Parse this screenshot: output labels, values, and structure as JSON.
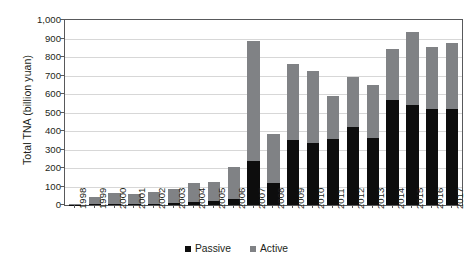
{
  "chart_data": {
    "type": "bar",
    "subtype": "stacked-vertical",
    "title": "",
    "xlabel": "",
    "ylabel": "Total TNA (billion yuan)",
    "ylim": [
      0,
      1000
    ],
    "ytick_values": [
      0,
      100,
      200,
      300,
      400,
      500,
      600,
      700,
      800,
      900,
      1000
    ],
    "ytick_labels": [
      "0",
      "100",
      "200",
      "300",
      "400",
      "500",
      "600",
      "700",
      "800",
      "900",
      "1,000"
    ],
    "grid": true,
    "grid_axis": "y",
    "legend_position": "bottom-center",
    "categories": [
      "1998",
      "1999",
      "2000",
      "2001",
      "2002",
      "2003",
      "2004",
      "2005",
      "2006",
      "2007",
      "2008",
      "2009",
      "2010",
      "2011",
      "2012",
      "2013",
      "2014",
      "2015",
      "2016",
      "2017"
    ],
    "series": [
      {
        "name": "Passive",
        "color": "#0d0d0d",
        "values": [
          2,
          3,
          5,
          5,
          6,
          10,
          18,
          22,
          35,
          240,
          120,
          350,
          335,
          355,
          420,
          360,
          570,
          540,
          520,
          520
        ]
      },
      {
        "name": "Active",
        "color": "#808285",
        "values": [
          3,
          42,
          60,
          55,
          62,
          75,
          102,
          103,
          170,
          645,
          265,
          410,
          390,
          235,
          270,
          290,
          275,
          395,
          335,
          355
        ]
      }
    ],
    "totals": [
      5,
      45,
      65,
      60,
      68,
      85,
      120,
      125,
      205,
      885,
      385,
      760,
      725,
      590,
      690,
      650,
      845,
      935,
      855,
      875
    ]
  },
  "legend": {
    "items": [
      {
        "label": "Passive",
        "color": "#0d0d0d"
      },
      {
        "label": "Active",
        "color": "#808285"
      }
    ]
  },
  "colors": {
    "passive": "#0d0d0d",
    "active": "#808285",
    "grid": "#d7d7d7",
    "axis": "#58595b",
    "text": "#231f20",
    "background": "#ffffff"
  }
}
